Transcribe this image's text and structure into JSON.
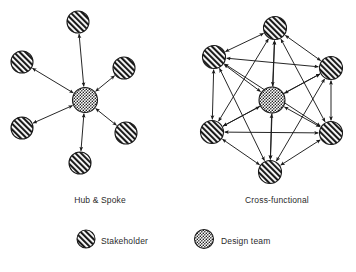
{
  "figure": {
    "background": "#ffffff",
    "line_color": "#1a1a1a",
    "node_stroke": "#1a1a1a",
    "stakeholder_fill": "hatch-diagonal",
    "design_team_fill": "stipple-dots"
  },
  "panels": [
    {
      "id": "hub-and-spoke",
      "caption": "Hub & Spoke",
      "caption_x": 100,
      "caption_y": 195,
      "type": "star",
      "hub": {
        "name": "design-team",
        "x": 85,
        "y": 100,
        "r": 12.5,
        "kind": "design-team"
      },
      "nodes": [
        {
          "name": "stakeholder-top",
          "x": 78,
          "y": 22,
          "r": 11,
          "kind": "stakeholder"
        },
        {
          "name": "stakeholder-upper-left",
          "x": 22,
          "y": 62,
          "r": 11,
          "kind": "stakeholder"
        },
        {
          "name": "stakeholder-upper-right",
          "x": 124,
          "y": 68,
          "r": 11,
          "kind": "stakeholder"
        },
        {
          "name": "stakeholder-lower-left",
          "x": 22,
          "y": 128,
          "r": 11,
          "kind": "stakeholder"
        },
        {
          "name": "stakeholder-lower-right",
          "x": 126,
          "y": 133,
          "r": 11,
          "kind": "stakeholder"
        },
        {
          "name": "stakeholder-bottom",
          "x": 80,
          "y": 163,
          "r": 11,
          "kind": "stakeholder"
        }
      ],
      "edges": [
        {
          "from": "hub",
          "to": 0,
          "double": true
        },
        {
          "from": "hub",
          "to": 1,
          "double": true
        },
        {
          "from": "hub",
          "to": 2,
          "double": true
        },
        {
          "from": "hub",
          "to": 3,
          "double": true
        },
        {
          "from": "hub",
          "to": 4,
          "double": true
        },
        {
          "from": "hub",
          "to": 5,
          "double": true
        }
      ]
    },
    {
      "id": "cross-functional",
      "caption": "Cross-functional",
      "caption_x": 277,
      "caption_y": 195,
      "type": "mesh",
      "hub": {
        "name": "design-team",
        "x": 272,
        "y": 100,
        "r": 13,
        "kind": "design-team"
      },
      "nodes": [
        {
          "name": "stakeholder-top",
          "x": 275,
          "y": 28,
          "r": 11.5,
          "kind": "stakeholder"
        },
        {
          "name": "stakeholder-upper-left",
          "x": 214,
          "y": 57,
          "r": 11.5,
          "kind": "stakeholder"
        },
        {
          "name": "stakeholder-upper-right",
          "x": 331,
          "y": 68,
          "r": 11.5,
          "kind": "stakeholder"
        },
        {
          "name": "stakeholder-lower-left",
          "x": 212,
          "y": 132,
          "r": 11.5,
          "kind": "stakeholder"
        },
        {
          "name": "stakeholder-lower-right",
          "x": 331,
          "y": 133,
          "r": 11.5,
          "kind": "stakeholder"
        },
        {
          "name": "stakeholder-bottom",
          "x": 270,
          "y": 172,
          "r": 11.5,
          "kind": "stakeholder"
        }
      ],
      "fully_connected": true
    }
  ],
  "legend": {
    "box": {
      "x": 30,
      "y": 213,
      "width": 300,
      "height": 48,
      "visible": false
    },
    "items": [
      {
        "name": "legend-stakeholder",
        "label": "Stakeholder",
        "kind": "stakeholder",
        "cx": 86,
        "cy": 239,
        "r": 9,
        "label_x": 101,
        "label_y": 236
      },
      {
        "name": "legend-design-team",
        "label": "Design team",
        "kind": "design-team",
        "cx": 204,
        "cy": 239,
        "r": 9.5,
        "label_x": 221,
        "label_y": 236
      }
    ]
  }
}
